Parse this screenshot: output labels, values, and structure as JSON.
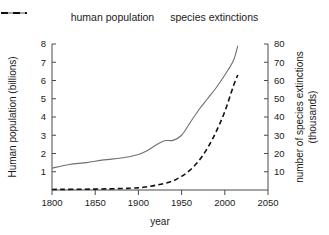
{
  "legend": {
    "position": "top-center",
    "entries": [
      {
        "label": "human population",
        "style": "solid",
        "color": "#6f6f6f",
        "icon": "solid-line-icon"
      },
      {
        "label": "species extinctions",
        "style": "dashed",
        "color": "#111111",
        "icon": "dashed-line-icon"
      }
    ]
  },
  "axes": {
    "x": {
      "label": "year",
      "ticks": [
        "1800",
        "1850",
        "1900",
        "1950",
        "2000",
        "2050"
      ]
    },
    "y_left": {
      "label": "Human population (billions)",
      "ticks": [
        "1",
        "2",
        "3",
        "4",
        "5",
        "6",
        "7",
        "8"
      ]
    },
    "y_right": {
      "label_line1": "number of species extinctions",
      "label_line2": "(thousands)",
      "ticks": [
        "10",
        "20",
        "30",
        "40",
        "50",
        "60",
        "70",
        "80"
      ]
    }
  },
  "chart_data": {
    "type": "line",
    "title": "",
    "xlabel": "year",
    "ylabel": "Human population (billions)",
    "ylabel_secondary": "number of species extinctions (thousands)",
    "xlim": [
      1800,
      2050
    ],
    "ylim": [
      0,
      8
    ],
    "ylim_secondary": [
      0,
      80
    ],
    "xticks": [
      1800,
      1850,
      1900,
      1950,
      2000,
      2050
    ],
    "yticks": [
      1,
      2,
      3,
      4,
      5,
      6,
      7,
      8
    ],
    "yticks_secondary": [
      10,
      20,
      30,
      40,
      50,
      60,
      70,
      80
    ],
    "grid": false,
    "legend_position": "top-center",
    "series": [
      {
        "name": "human population",
        "axis": "left",
        "units": "billions",
        "style": "solid",
        "color": "#6f6f6f",
        "x": [
          1800,
          1820,
          1840,
          1860,
          1880,
          1900,
          1910,
          1920,
          1930,
          1940,
          1950,
          1960,
          1970,
          1980,
          1990,
          2000,
          2010,
          2015
        ],
        "values": [
          1.2,
          1.4,
          1.5,
          1.65,
          1.75,
          1.95,
          2.15,
          2.45,
          2.7,
          2.72,
          3.0,
          3.7,
          4.4,
          5.0,
          5.6,
          6.3,
          7.1,
          7.9
        ]
      },
      {
        "name": "species extinctions",
        "axis": "right",
        "units": "thousands",
        "style": "dashed",
        "color": "#111111",
        "x": [
          1800,
          1850,
          1880,
          1900,
          1910,
          1920,
          1930,
          1940,
          1950,
          1960,
          1970,
          1980,
          1990,
          2000,
          2010,
          2015
        ],
        "values": [
          0.3,
          0.5,
          0.8,
          1.2,
          1.8,
          2.6,
          3.6,
          5.0,
          7.5,
          11.0,
          16.0,
          23.0,
          32.0,
          43.0,
          57.0,
          63.0
        ]
      }
    ]
  }
}
